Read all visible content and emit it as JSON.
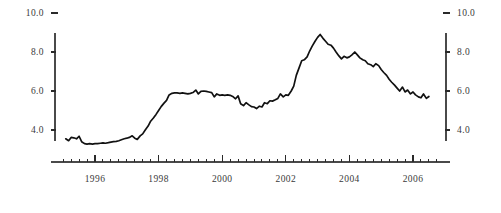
{
  "chart_data": {
    "type": "line",
    "title": "",
    "subtitle": "",
    "xlabel": "",
    "ylabel": "",
    "xlim": [
      1995.0,
      2006.75
    ],
    "ylim": [
      3.0,
      10.0
    ],
    "grid": false,
    "legend": null,
    "y_ticks": [
      "10.0",
      "8.0",
      "6.0",
      "4.0"
    ],
    "y_tick_values": [
      10.0,
      8.0,
      6.0,
      4.0
    ],
    "x_ticks": [
      "1996",
      "1998",
      "2000",
      "2002",
      "2004",
      "2006"
    ],
    "x_tick_values": [
      1996,
      1998,
      2000,
      2002,
      2004,
      2006
    ],
    "x_minor_per_major": 3,
    "axis_color": "#2a2a2a",
    "series_color": "#111111",
    "series": [
      {
        "name": "series-1",
        "x": [
          1995.08,
          1995.17,
          1995.25,
          1995.33,
          1995.42,
          1995.5,
          1995.58,
          1995.67,
          1995.75,
          1995.83,
          1995.92,
          1996.0,
          1996.08,
          1996.17,
          1996.25,
          1996.33,
          1996.42,
          1996.5,
          1996.58,
          1996.67,
          1996.75,
          1996.83,
          1996.92,
          1997.0,
          1997.08,
          1997.17,
          1997.25,
          1997.33,
          1997.42,
          1997.5,
          1997.58,
          1997.67,
          1997.75,
          1997.83,
          1997.92,
          1998.0,
          1998.08,
          1998.17,
          1998.25,
          1998.33,
          1998.42,
          1998.5,
          1998.58,
          1998.67,
          1998.75,
          1998.83,
          1998.92,
          1999.0,
          1999.08,
          1999.17,
          1999.25,
          1999.33,
          1999.42,
          1999.5,
          1999.58,
          1999.67,
          1999.75,
          1999.83,
          1999.92,
          2000.0,
          2000.08,
          2000.17,
          2000.25,
          2000.33,
          2000.42,
          2000.5,
          2000.58,
          2000.67,
          2000.75,
          2000.83,
          2000.92,
          2001.0,
          2001.08,
          2001.17,
          2001.25,
          2001.33,
          2001.42,
          2001.5,
          2001.58,
          2001.67,
          2001.75,
          2001.83,
          2001.92,
          2002.0,
          2002.08,
          2002.17,
          2002.25,
          2002.33,
          2002.42,
          2002.5,
          2002.58,
          2002.67,
          2002.75,
          2002.83,
          2002.92,
          2003.0,
          2003.08,
          2003.17,
          2003.25,
          2003.33,
          2003.42,
          2003.5,
          2003.58,
          2003.67,
          2003.75,
          2003.83,
          2003.92,
          2004.0,
          2004.08,
          2004.17,
          2004.25,
          2004.33,
          2004.42,
          2004.5,
          2004.58,
          2004.67,
          2004.75,
          2004.83,
          2004.92,
          2005.0,
          2005.08,
          2005.17,
          2005.25,
          2005.33,
          2005.42,
          2005.5,
          2005.58,
          2005.67,
          2005.75,
          2005.83,
          2005.92,
          2006.0,
          2006.08,
          2006.17,
          2006.25,
          2006.33,
          2006.42,
          2006.5
        ],
        "values": [
          3.55,
          3.45,
          3.62,
          3.6,
          3.55,
          3.68,
          3.4,
          3.3,
          3.28,
          3.3,
          3.28,
          3.3,
          3.3,
          3.32,
          3.34,
          3.32,
          3.35,
          3.38,
          3.4,
          3.42,
          3.45,
          3.5,
          3.55,
          3.58,
          3.62,
          3.7,
          3.58,
          3.52,
          3.7,
          3.8,
          4.0,
          4.2,
          4.45,
          4.6,
          4.8,
          5.0,
          5.2,
          5.38,
          5.52,
          5.8,
          5.88,
          5.9,
          5.9,
          5.88,
          5.9,
          5.88,
          5.85,
          5.88,
          5.92,
          6.05,
          5.85,
          5.98,
          6.0,
          5.98,
          5.95,
          5.92,
          5.7,
          5.85,
          5.78,
          5.8,
          5.78,
          5.8,
          5.78,
          5.72,
          5.6,
          5.75,
          5.35,
          5.25,
          5.4,
          5.3,
          5.2,
          5.18,
          5.1,
          5.22,
          5.18,
          5.4,
          5.35,
          5.5,
          5.48,
          5.55,
          5.62,
          5.85,
          5.7,
          5.8,
          5.78,
          6.0,
          6.25,
          6.8,
          7.2,
          7.55,
          7.6,
          7.75,
          8.05,
          8.3,
          8.55,
          8.75,
          8.9,
          8.7,
          8.55,
          8.4,
          8.35,
          8.2,
          8.0,
          7.8,
          7.65,
          7.78,
          7.7,
          7.75,
          7.85,
          8.0,
          7.85,
          7.7,
          7.6,
          7.55,
          7.4,
          7.35,
          7.25,
          7.4,
          7.3,
          7.1,
          6.95,
          6.8,
          6.6,
          6.45,
          6.3,
          6.15,
          6.0,
          6.2,
          5.95,
          6.05,
          5.85,
          5.95,
          5.8,
          5.7,
          5.65,
          5.85,
          5.62,
          5.72
        ]
      }
    ]
  },
  "axes": {
    "left_tick_labels": [
      "10.0",
      "8.0",
      "6.0",
      "4.0"
    ],
    "right_tick_labels": [
      "10.0",
      "8.0",
      "6.0",
      "4.0"
    ],
    "bottom_tick_labels": [
      "1996",
      "1998",
      "2000",
      "2002",
      "2004",
      "2006"
    ]
  }
}
